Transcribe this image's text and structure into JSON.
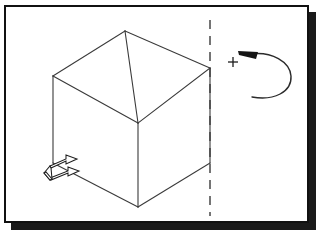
{
  "figure": {
    "background_color": "#ffffff",
    "frame": {
      "border_color": "#111111",
      "shadow_color": "#1a1a1a",
      "x": 4,
      "y": 5,
      "width": 305,
      "height": 218,
      "shadow_offset": 7
    }
  },
  "cube": {
    "label": "isometric-cube",
    "edge_color": "#3a3a3a",
    "edge_width": 1.1,
    "vertices": {
      "top_apex": [
        125,
        31
      ],
      "top_left": [
        53,
        76
      ],
      "top_right": [
        210,
        68
      ],
      "top_front": [
        138,
        123
      ],
      "bottom_left": [
        53,
        163
      ],
      "bottom_right": [
        210,
        163
      ],
      "bottom_front": [
        138,
        207
      ]
    },
    "edges": [
      [
        [
          125,
          31
        ],
        [
          53,
          76
        ]
      ],
      [
        [
          125,
          31
        ],
        [
          210,
          68
        ]
      ],
      [
        [
          53,
          76
        ],
        [
          138,
          123
        ]
      ],
      [
        [
          210,
          68
        ],
        [
          138,
          123
        ]
      ],
      [
        [
          53,
          76
        ],
        [
          53,
          163
        ]
      ],
      [
        [
          210,
          68
        ],
        [
          210,
          163
        ]
      ],
      [
        [
          138,
          123
        ],
        [
          138,
          207
        ]
      ],
      [
        [
          53,
          163
        ],
        [
          138,
          207
        ]
      ],
      [
        [
          210,
          163
        ],
        [
          138,
          207
        ]
      ],
      [
        [
          125,
          31
        ],
        [
          138,
          123
        ]
      ]
    ]
  },
  "axis": {
    "label": "rotation-axis-dashed-line",
    "x": 210,
    "y_start": 20,
    "y_end": 216,
    "color": "#3a3a3a",
    "style": "dashed",
    "dash_pattern": "9 7",
    "width": 1.4
  },
  "rotation_symbol": {
    "label": "positive-rotation-arrow",
    "sign": "+",
    "sign_position": [
      233,
      62
    ],
    "direction": "counterclockwise-arrowhead-left",
    "curve_color": "#2b2b2b",
    "arrowhead_color": "#151515",
    "curve_path": "M 252 55 C 288 58, 296 100, 270 96",
    "arc_center": [
      266,
      76
    ],
    "arc_radius_x": 26,
    "arc_radius_y": 24
  },
  "translation_symbol": {
    "label": "double-translation-arrow",
    "position": [
      62,
      166
    ],
    "direction": "up-right-isometric",
    "arrow_count": 2,
    "fill_color": "#ffffff",
    "stroke_color": "#1d1d1d",
    "arrows": [
      {
        "name": "upper-arrow",
        "tail": [
          48,
          168
        ],
        "tip": [
          82,
          155
        ]
      },
      {
        "name": "lower-arrow",
        "tail": [
          48,
          180
        ],
        "tip": [
          82,
          172
        ]
      }
    ]
  }
}
